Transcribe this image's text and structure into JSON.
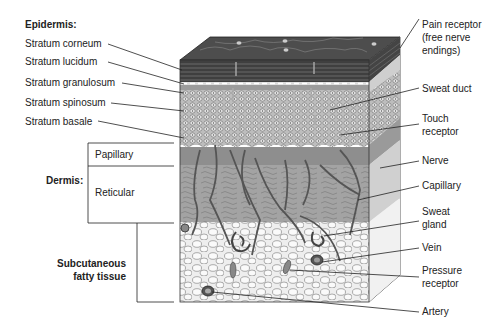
{
  "diagram": {
    "type": "anatomical cross-section"
  },
  "left_labels": {
    "epidermis_heading": "Epidermis:",
    "epidermis_layers": [
      "Stratum corneum",
      "Stratum lucidum",
      "Stratum granulosum",
      "Stratum spinosum",
      "Stratum basale"
    ],
    "dermis_heading": "Dermis:",
    "dermis_layers": [
      "Papillary",
      "Reticular"
    ],
    "subcutaneous_line1": "Subcutaneous",
    "subcutaneous_line2": "fatty tissue"
  },
  "right_labels": {
    "pain_receptor": [
      "Pain receptor",
      "(free nerve",
      "endings)"
    ],
    "sweat_duct": "Sweat duct",
    "touch_receptor": [
      "Touch",
      "receptor"
    ],
    "nerve": "Nerve",
    "capillary": "Capillary",
    "sweat_gland": [
      "Sweat",
      "gland"
    ],
    "vein": "Vein",
    "pressure_receptor": [
      "Pressure",
      "receptor"
    ],
    "artery": "Artery"
  },
  "colors": {
    "corneum": "#4a4a4a",
    "epidermis_cells": "#d8d8d8",
    "papillary": "#8f8f8f",
    "reticular": "#a9a9a9",
    "subcutaneous": "#efefef",
    "line": "#333333"
  }
}
